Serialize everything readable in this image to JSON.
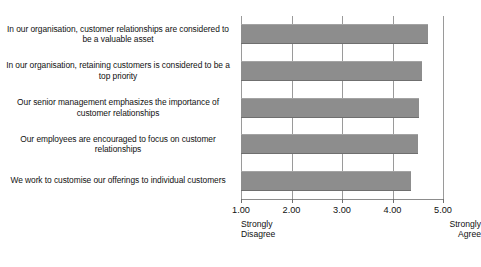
{
  "chart_data": {
    "type": "bar",
    "orientation": "horizontal",
    "title": "",
    "xlabel": "",
    "ylabel": "",
    "xlim": [
      1.0,
      5.0
    ],
    "grid": true,
    "legend": false,
    "categories": [
      "In our organisation, customer relationships are considered to be a valuable asset",
      "In our organisation, retaining customers is considered to be a top priority",
      "Our senior management emphasizes the importance of customer relationships",
      "Our employees are encouraged to focus on customer relationships",
      "We work to customise our offerings to individual customers"
    ],
    "values": [
      4.7,
      4.58,
      4.52,
      4.5,
      4.37
    ],
    "xticks": [
      "1.00",
      "2.00",
      "3.00",
      "4.00",
      "5.00"
    ],
    "xtick_values": [
      1,
      2,
      3,
      4,
      5
    ],
    "scale_anchors": {
      "low": "Strongly\nDisagree",
      "low_line1": "Strongly",
      "low_line2": "Disagree",
      "high_line1": "Strongly",
      "high_line2": "Agree"
    },
    "colors": {
      "bar_fill": "#8d8d8d",
      "gridline": "#9a9a9a",
      "axis": "#8c8c8c",
      "text": "#111111",
      "background": "#ffffff"
    }
  }
}
